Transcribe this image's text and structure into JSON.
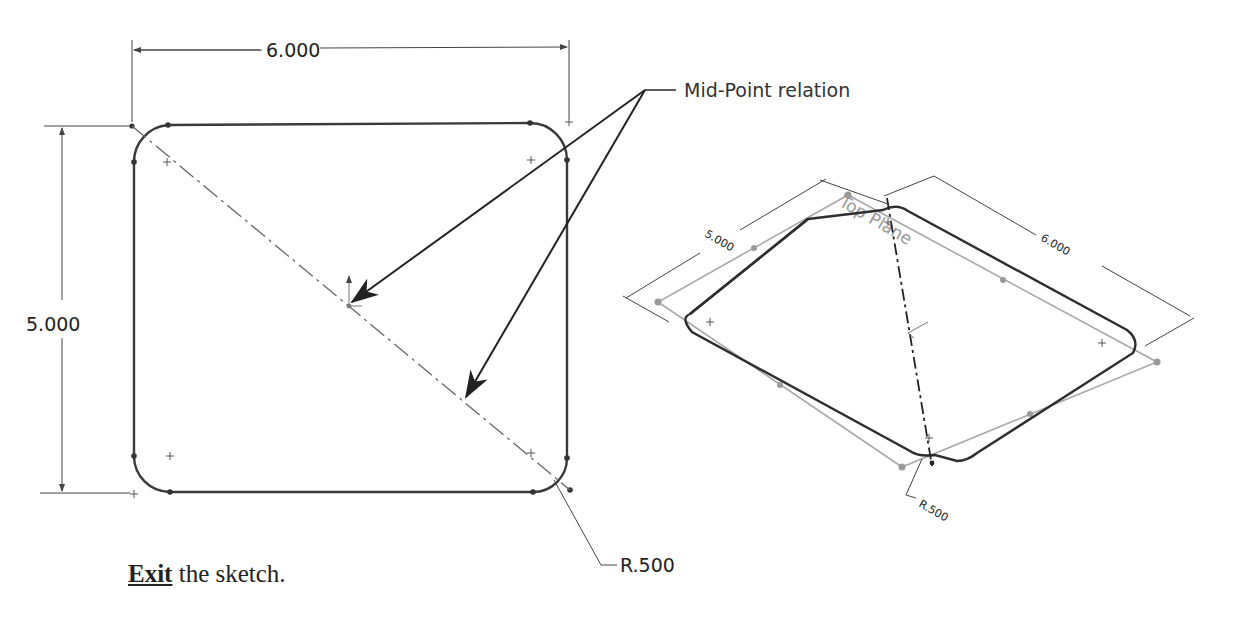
{
  "front_view": {
    "width_dimension": "6.000",
    "height_dimension": "5.000",
    "fillet_radius": "R.500"
  },
  "callout": {
    "label": "Mid-Point relation"
  },
  "iso_view": {
    "plane_label": "Top Plane",
    "width_dimension": "6.000",
    "height_dimension": "5.000",
    "fillet_radius": "R.500"
  },
  "instruction": {
    "action": "Exit",
    "rest": " the sketch."
  },
  "colors": {
    "sketch_line": "#333333",
    "dimension_line": "#555555",
    "plane_outline": "#a0a0a0"
  }
}
